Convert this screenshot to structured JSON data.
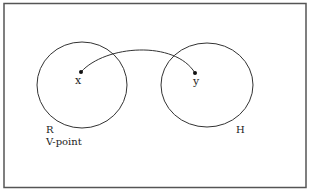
{
  "diagram": {
    "sets": [
      {
        "id": "R",
        "label": "R",
        "sublabel": "V-point"
      },
      {
        "id": "H",
        "label": "H"
      }
    ],
    "points": [
      {
        "id": "x",
        "label": "x",
        "set": "R"
      },
      {
        "id": "y",
        "label": "y",
        "set": "H"
      }
    ],
    "edges": [
      {
        "from": "x",
        "to": "y",
        "style": "curved"
      }
    ],
    "colors": {
      "stroke": "#333333",
      "border": "#555555",
      "background": "#ffffff"
    }
  }
}
